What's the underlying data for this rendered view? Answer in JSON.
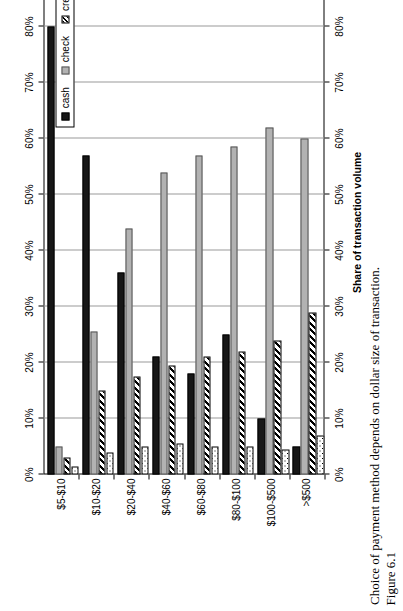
{
  "figure": {
    "number_label": "Figure 6.1",
    "caption": "Choice of payment method depends on dollar size of transaction."
  },
  "legend": {
    "position": "inside-upper-left",
    "items": [
      {
        "label": "cash",
        "pattern": "solid-black",
        "color": "#171717"
      },
      {
        "label": "check",
        "pattern": "solid-gray",
        "color": "#b2b2b2"
      },
      {
        "label": "credit/charge",
        "pattern": "diagonal-hatch",
        "color": "#000000"
      },
      {
        "label": "other/debit",
        "pattern": "dotted",
        "color": "#000000"
      }
    ]
  },
  "chart_data": {
    "type": "bar",
    "orientation": "horizontal",
    "title": "",
    "xlabel": "",
    "ylabel": "Share of transaction volume",
    "ylim": [
      0,
      90
    ],
    "grid": true,
    "axis_tick_labels": [
      "0%",
      "10%",
      "20%",
      "30%",
      "40%",
      "50%",
      "60%",
      "70%",
      "80%",
      "90%"
    ],
    "axis_ticks": [
      0,
      10,
      20,
      30,
      40,
      50,
      60,
      70,
      80,
      90
    ],
    "duplicate_axis": "top-and-bottom",
    "categories": [
      "$5-$10",
      "$10-$20",
      "$20-$40",
      "$40-$60",
      "$60-$80",
      "$80-$100",
      "$100-$500",
      ">$500"
    ],
    "series": [
      {
        "name": "cash",
        "values": [
          80.0,
          57.0,
          36.0,
          21.0,
          18.0,
          25.0,
          10.0,
          5.0
        ]
      },
      {
        "name": "check",
        "values": [
          5.0,
          25.5,
          44.0,
          54.0,
          57.0,
          58.5,
          62.0,
          60.0
        ]
      },
      {
        "name": "credit/charge",
        "values": [
          3.0,
          15.0,
          17.5,
          19.5,
          21.0,
          22.0,
          24.0,
          29.0
        ]
      },
      {
        "name": "other/debit",
        "values": [
          1.5,
          4.0,
          5.0,
          5.5,
          5.0,
          5.0,
          4.5,
          7.0
        ]
      }
    ]
  }
}
